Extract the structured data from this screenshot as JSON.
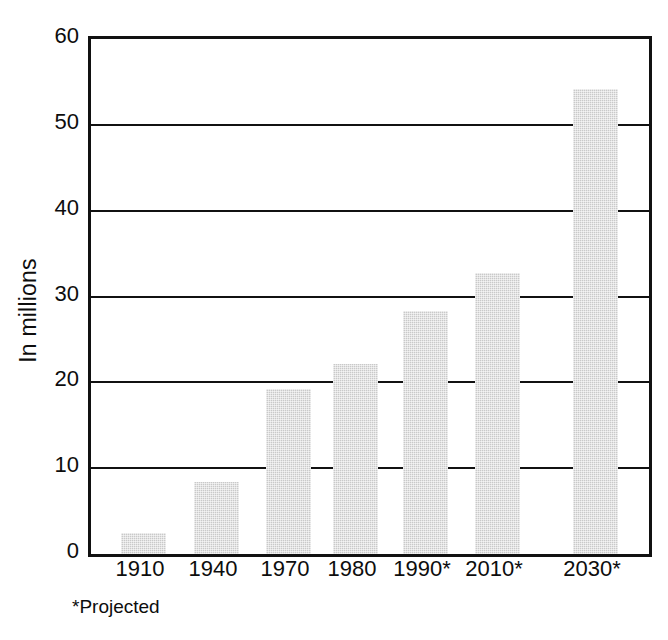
{
  "chart_data": {
    "type": "bar",
    "title": "",
    "subtitle": "",
    "xlabel": "",
    "ylabel": "In millions",
    "categories": [
      "1910",
      "1940",
      "1970",
      "1980",
      "1990*",
      "2010*",
      "2030*"
    ],
    "values": [
      2.5,
      8.4,
      19.2,
      22.1,
      28.3,
      32.7,
      54.2
    ],
    "ylim": [
      0,
      60
    ],
    "xlim_note": "categorical",
    "y_ticks": [
      0,
      10,
      20,
      30,
      40,
      50,
      60
    ],
    "y_tick_labels": [
      "0",
      "10",
      "20",
      "30",
      "40",
      "50",
      "60"
    ],
    "grid": "horizontal",
    "legend": "none",
    "annotations": [
      "*Projected"
    ],
    "bar_color": "#c9c9c9",
    "axis_color": "#111111",
    "background_color": "#ffffff"
  },
  "axes": {
    "y_title": "In millions",
    "y_tick_labels": [
      "60",
      "50",
      "40",
      "30",
      "20",
      "10",
      "0"
    ],
    "x_tick_labels": [
      "1910",
      "1940",
      "1970",
      "1980",
      "1990*",
      "2010*",
      "2030*"
    ]
  },
  "footnote": {
    "text": "*Projected"
  }
}
